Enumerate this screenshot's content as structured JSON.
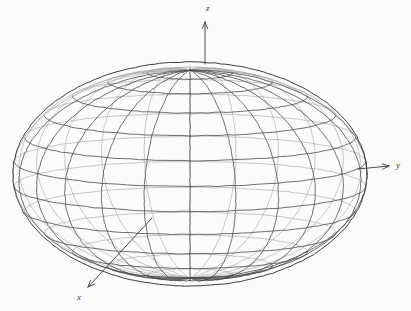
{
  "figure": {
    "background_color": "#fbfbfb",
    "line_color": "#4a4a4a",
    "line_color_back": "#9a9a9a",
    "axis_color": "#3a3a3a",
    "label_color": "#3a3a3a",
    "style": "hand-drawn pencil sketch"
  },
  "axes": {
    "z": {
      "label": "z",
      "label_x": 206,
      "label_y": 11,
      "line": {
        "x1": 205,
        "y1": 64,
        "x2": 205,
        "y2": 22
      },
      "arrow": "up"
    },
    "y": {
      "label": "y",
      "label_x": 396,
      "label_y": 168,
      "line": {
        "x1": 358,
        "y1": 169,
        "x2": 389,
        "y2": 166
      },
      "arrow": "right"
    },
    "x": {
      "label": "x",
      "label_x": 77,
      "label_y": 300,
      "line": {
        "x1": 152,
        "y1": 218,
        "x2": 88,
        "y2": 287
      },
      "arrow": "down-left"
    }
  },
  "chart_data": {
    "type": "surface",
    "title": "",
    "xlabel": "x",
    "ylabel": "y",
    "zlabel": "z",
    "shape": "oblate-ellipsoid",
    "projection": {
      "center_x": 190,
      "center_y": 174,
      "semi_axis_horizontal": 177,
      "semi_axis_vertical": 112,
      "elevation_deg": 22,
      "azimuth_deg": 0
    },
    "mesh": {
      "meridians": 24,
      "parallels": 13,
      "grid": true
    },
    "legend": "none",
    "annotations": [
      "z",
      "y",
      "x"
    ]
  }
}
